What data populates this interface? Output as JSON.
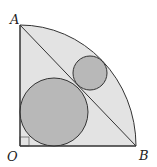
{
  "diagram": {
    "type": "geometry",
    "labels": {
      "A": "A",
      "B": "B",
      "O": "O"
    },
    "colors": {
      "sector_fill": "#e3e3e3",
      "circle_fill": "#b8b8b8",
      "stroke": "#333333"
    }
  }
}
